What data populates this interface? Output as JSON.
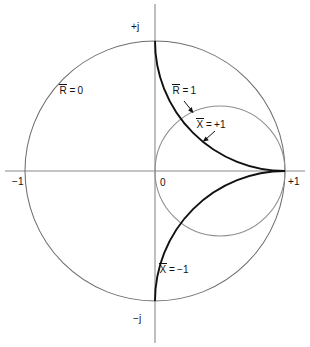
{
  "figure": {
    "type": "diagram",
    "background": "#ffffff",
    "geometry": {
      "origin_px": [
        155,
        171
      ],
      "unit_radius_px": 130,
      "x_axis_y_px": 171,
      "y_axis_x_px": 155
    },
    "colors": {
      "axis": "#8a8a8a",
      "thin_circle": "#6e6e6e",
      "heavy_curve": "#111111",
      "text": "#111111"
    }
  },
  "axes": {
    "horizontal_label": "real axis",
    "vertical_label": "imaginary axis",
    "ticks": [
      {
        "name": "left",
        "text": "−1",
        "value": -1
      },
      {
        "name": "origin",
        "text": "0",
        "value": 0
      },
      {
        "name": "right",
        "text": "+1",
        "value": 1
      },
      {
        "name": "top",
        "text": "+j",
        "value": 1
      },
      {
        "name": "bottom",
        "text": "−j",
        "value": -1
      }
    ]
  },
  "curves": [
    {
      "id": "r0",
      "symbol": "R",
      "overbar": true,
      "relation": "=",
      "value": "0",
      "label_text": "R = 0",
      "style": "thin",
      "description": "unit circle, normalized resistance equals zero",
      "circle": {
        "center": [
          0,
          0
        ],
        "radius": 1
      }
    },
    {
      "id": "r1",
      "symbol": "R",
      "overbar": true,
      "relation": "=",
      "value": "1",
      "label_text": "R = 1",
      "style": "thin",
      "description": "constant normalized resistance circle r = 1",
      "circle": {
        "center": [
          0.5,
          0
        ],
        "radius": 0.5
      },
      "arrow": {
        "from": [
          0.23,
          0.6
        ],
        "to": [
          0.13,
          0.5
        ]
      }
    },
    {
      "id": "xp1",
      "symbol": "X",
      "overbar": true,
      "relation": "=",
      "value": "+1",
      "label_text": "X = +1",
      "style": "heavy",
      "description": "constant normalized reactance arc x = +1",
      "circle": {
        "center": [
          1,
          1
        ],
        "radius": 1
      },
      "arrow": {
        "from": [
          0.52,
          0.33
        ],
        "to": [
          0.4,
          0.23
        ]
      }
    },
    {
      "id": "xm1",
      "symbol": "X",
      "overbar": true,
      "relation": "=",
      "value": "−1",
      "label_text": "X = −1",
      "style": "heavy",
      "description": "constant normalized reactance arc x = -1",
      "circle": {
        "center": [
          1,
          -1
        ],
        "radius": 1
      }
    }
  ],
  "labels": {
    "plus_j": "+j",
    "minus_j": "−j",
    "minus_one": "−1",
    "zero": "0",
    "plus_one": "+1",
    "r_symbol": "R",
    "x_symbol": "X",
    "equals": "=",
    "r0_value": "0",
    "r1_value": "1",
    "xp1_value": "+1",
    "xm1_value": "−1"
  }
}
